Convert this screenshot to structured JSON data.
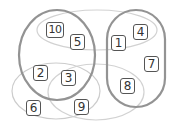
{
  "diagram": {
    "type": "euler-hypergraph",
    "colors": {
      "thick_outline": "#8f8f8f",
      "thin_outline": "#cfcfcf",
      "node_border": "#555555",
      "node_text": "#333333",
      "background": "#ffffff"
    },
    "nodes": [
      {
        "id": "10",
        "label": "10",
        "x": 55,
        "y": 30
      },
      {
        "id": "5",
        "label": "5",
        "x": 77,
        "y": 42
      },
      {
        "id": "1",
        "label": "1",
        "x": 118,
        "y": 43
      },
      {
        "id": "4",
        "label": "4",
        "x": 140,
        "y": 32
      },
      {
        "id": "7",
        "label": "7",
        "x": 151,
        "y": 64
      },
      {
        "id": "8",
        "label": "8",
        "x": 127,
        "y": 86
      },
      {
        "id": "2",
        "label": "2",
        "x": 40,
        "y": 73
      },
      {
        "id": "3",
        "label": "3",
        "x": 68,
        "y": 78
      },
      {
        "id": "6",
        "label": "6",
        "x": 33,
        "y": 108
      },
      {
        "id": "9",
        "label": "9",
        "x": 81,
        "y": 107
      }
    ],
    "sets": [
      {
        "name": "left-thick-set",
        "members": [
          "10",
          "5",
          "2",
          "3"
        ],
        "style": "thick"
      },
      {
        "name": "right-thick-set",
        "members": [
          "1",
          "4",
          "7",
          "8"
        ],
        "style": "thick"
      },
      {
        "name": "top-thin-set",
        "members": [
          "10",
          "5",
          "1",
          "4"
        ],
        "style": "thin"
      },
      {
        "name": "bottom-left-thin-set",
        "members": [
          "2",
          "3",
          "6",
          "9"
        ],
        "style": "thin"
      },
      {
        "name": "bottom-middle-thin-set",
        "members": [
          "3",
          "9",
          "8"
        ],
        "style": "thin"
      }
    ]
  }
}
